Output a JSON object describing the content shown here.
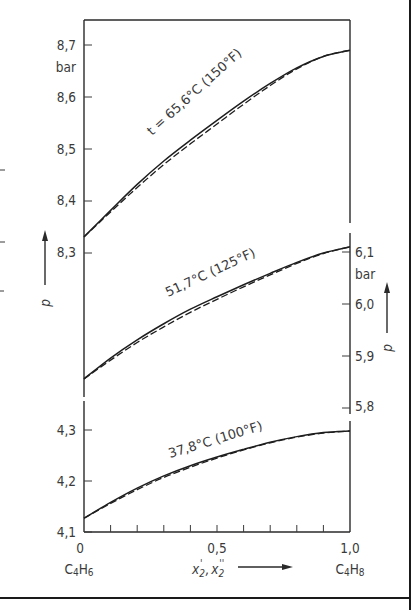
{
  "chart_data": {
    "type": "line",
    "title": "",
    "xlabel": "x'2 , x''2",
    "xlabel_parts": {
      "main": "x",
      "sub1": "2",
      "sup1": "'",
      "sep": ",",
      "sub2": "2",
      "sup2": "''"
    },
    "ylabel": "p",
    "x_ticks": [
      "0",
      "0,5",
      "1,0"
    ],
    "x_range": [
      0,
      1.0
    ],
    "x_end_labels": {
      "left": "C4H6",
      "right": "C4H8"
    },
    "x_end_label_parts": {
      "left": {
        "a": "C",
        "sa": "4",
        "b": "H",
        "sb": "6"
      },
      "right": {
        "a": "C",
        "sa": "4",
        "b": "H",
        "sb": "8"
      }
    },
    "unit": "bar",
    "panels": [
      {
        "name": "top",
        "axis_side": "left",
        "ylim": [
          8.25,
          8.75
        ],
        "y_ticks": [
          "8,3",
          "8,4",
          "8,5",
          "8,6",
          "8,7"
        ],
        "y_tick_values": [
          8.3,
          8.4,
          8.5,
          8.6,
          8.7
        ],
        "label": "t = 65,6°C (150°F)",
        "x": [
          0,
          0.1,
          0.2,
          0.3,
          0.4,
          0.5,
          0.6,
          0.7,
          0.8,
          0.9,
          1.0
        ],
        "series": [
          {
            "name": "bubble (x'2)",
            "style": "solid",
            "values": [
              8.331,
              8.382,
              8.432,
              8.477,
              8.517,
              8.555,
              8.592,
              8.626,
              8.656,
              8.678,
              8.69
            ]
          },
          {
            "name": "dew (x''2)",
            "style": "dashed",
            "values": [
              8.331,
              8.379,
              8.426,
              8.47,
              8.51,
              8.548,
              8.586,
              8.622,
              8.654,
              8.678,
              8.69
            ]
          }
        ]
      },
      {
        "name": "middle",
        "axis_side": "right",
        "ylim": [
          5.75,
          6.15
        ],
        "y_ticks": [
          "5,8",
          "5,9",
          "6,0",
          "6,1"
        ],
        "y_tick_values": [
          5.8,
          5.9,
          6.0,
          6.1
        ],
        "label": "51,7°C (125°F)",
        "x": [
          0,
          0.1,
          0.2,
          0.3,
          0.4,
          0.5,
          0.6,
          0.7,
          0.8,
          0.9,
          1.0
        ],
        "series": [
          {
            "name": "bubble (x'2)",
            "style": "solid",
            "values": [
              5.856,
              5.896,
              5.931,
              5.962,
              5.99,
              6.014,
              6.037,
              6.059,
              6.08,
              6.098,
              6.11
            ]
          },
          {
            "name": "dew (x''2)",
            "style": "dashed",
            "values": [
              5.856,
              5.892,
              5.926,
              5.956,
              5.984,
              6.009,
              6.033,
              6.056,
              6.078,
              6.097,
              6.11
            ]
          }
        ]
      },
      {
        "name": "bottom",
        "axis_side": "left",
        "ylim": [
          4.1,
          4.35
        ],
        "y_ticks": [
          "4,1",
          "4,2",
          "4,3"
        ],
        "y_tick_values": [
          4.1,
          4.2,
          4.3
        ],
        "label": "37,8°C (100°F)",
        "x": [
          0,
          0.1,
          0.2,
          0.3,
          0.4,
          0.5,
          0.6,
          0.7,
          0.8,
          0.9,
          1.0
        ],
        "series": [
          {
            "name": "bubble (x'2)",
            "style": "solid",
            "values": [
              4.127,
              4.158,
              4.186,
              4.21,
              4.23,
              4.247,
              4.262,
              4.276,
              4.287,
              4.295,
              4.298
            ]
          },
          {
            "name": "dew (x''2)",
            "style": "dashed",
            "values": [
              4.127,
              4.156,
              4.183,
              4.207,
              4.227,
              4.245,
              4.261,
              4.275,
              4.286,
              4.294,
              4.298
            ]
          }
        ]
      }
    ],
    "grid": false,
    "legend": "none"
  }
}
